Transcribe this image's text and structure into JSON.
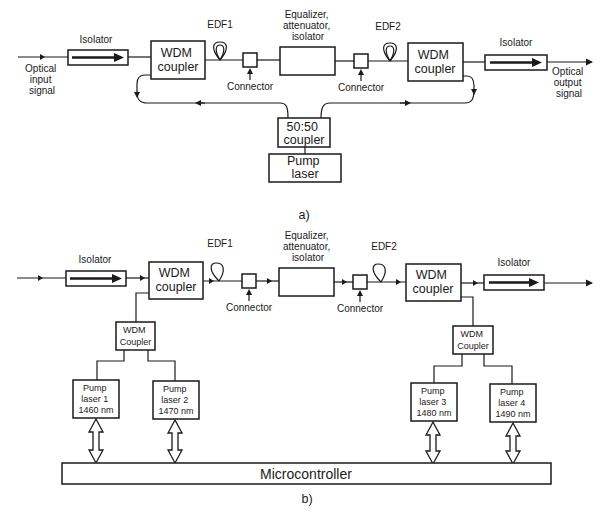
{
  "diagram_a": {
    "caption": "a)",
    "input_label": [
      "Optical",
      "input",
      "signal"
    ],
    "output_label": [
      "Optical",
      "output",
      "signal"
    ],
    "isolator_in": "Isolator",
    "isolator_out": "Isolator",
    "wdm1": [
      "WDM",
      "coupler"
    ],
    "wdm2": [
      "WDM",
      "coupler"
    ],
    "edf1": "EDF1",
    "edf2": "EDF2",
    "connector1": "Connector",
    "connector2": "Connector",
    "equalizer": [
      "Equalizer,",
      "attenuator,",
      "isolator"
    ],
    "splitter": [
      "50:50",
      "coupler"
    ],
    "pump": [
      "Pump",
      "laser"
    ]
  },
  "diagram_b": {
    "caption": "b)",
    "isolator_in": "Isolator",
    "isolator_out": "Isolator",
    "wdm1": [
      "WDM",
      "coupler"
    ],
    "wdm2": [
      "WDM",
      "coupler"
    ],
    "edf1": "EDF1",
    "edf2": "EDF2",
    "connector1": "Connector",
    "connector2": "Connector",
    "equalizer": [
      "Equalizer,",
      "attenuator,",
      "isolator"
    ],
    "wdm_sub1": [
      "WDM",
      "Coupler"
    ],
    "wdm_sub2": [
      "WDM",
      "Coupler"
    ],
    "pumps": [
      {
        "l1": "Pump",
        "l2": "laser 1",
        "l3": "1460 nm"
      },
      {
        "l1": "Pump",
        "l2": "laser 2",
        "l3": "1470 nm"
      },
      {
        "l1": "Pump",
        "l2": "laser 3",
        "l3": "1480 nm"
      },
      {
        "l1": "Pump",
        "l2": "laser 4",
        "l3": "1490 nm"
      }
    ],
    "microcontroller": "Microcontroller"
  }
}
